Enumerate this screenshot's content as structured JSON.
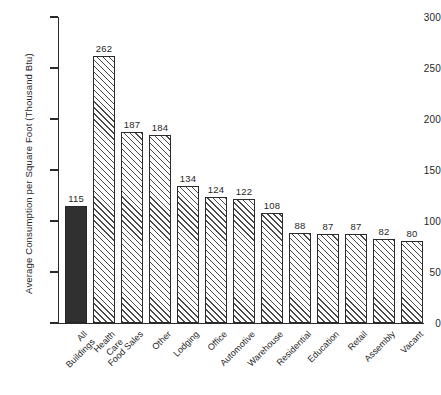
{
  "chart_data": {
    "type": "bar",
    "title": "",
    "xlabel": "",
    "ylabel": "Average Consumption per Square Foot (Thousand Btu)",
    "ylim": [
      0,
      300
    ],
    "yticks": [
      0,
      50,
      100,
      150,
      200,
      250,
      300
    ],
    "grid": false,
    "legend": "none",
    "categories": [
      "All Buildings",
      "Health Care",
      "Food Sales",
      "Other",
      "Lodging",
      "Office",
      "Automotive",
      "Warehouse",
      "Residential",
      "Education",
      "Retail",
      "Assembly",
      "Vacant"
    ],
    "category_lines": [
      [
        "All",
        "Buildings"
      ],
      [
        "Health",
        "Care"
      ],
      [
        "Food Sales"
      ],
      [
        "Other"
      ],
      [
        "Lodging"
      ],
      [
        "Office"
      ],
      [
        "Automotive"
      ],
      [
        "Warehouse"
      ],
      [
        "Residential"
      ],
      [
        "Education"
      ],
      [
        "Retail"
      ],
      [
        "Assembly"
      ],
      [
        "Vacant"
      ]
    ],
    "values": [
      115,
      262,
      187,
      184,
      134,
      124,
      122,
      108,
      88,
      87,
      87,
      82,
      80
    ],
    "bar_styles": [
      "solid",
      "hatched",
      "hatched",
      "hatched",
      "hatched",
      "hatched",
      "hatched",
      "hatched",
      "hatched",
      "hatched",
      "hatched",
      "hatched",
      "hatched"
    ],
    "colors": {
      "highlight_bar": "#303030",
      "hatch_line": "#4a4a4a",
      "bar_outline": "#2b2b2b",
      "axis": "#2b2b2b",
      "text": "#1f1f1f",
      "background": "#ffffff"
    }
  }
}
